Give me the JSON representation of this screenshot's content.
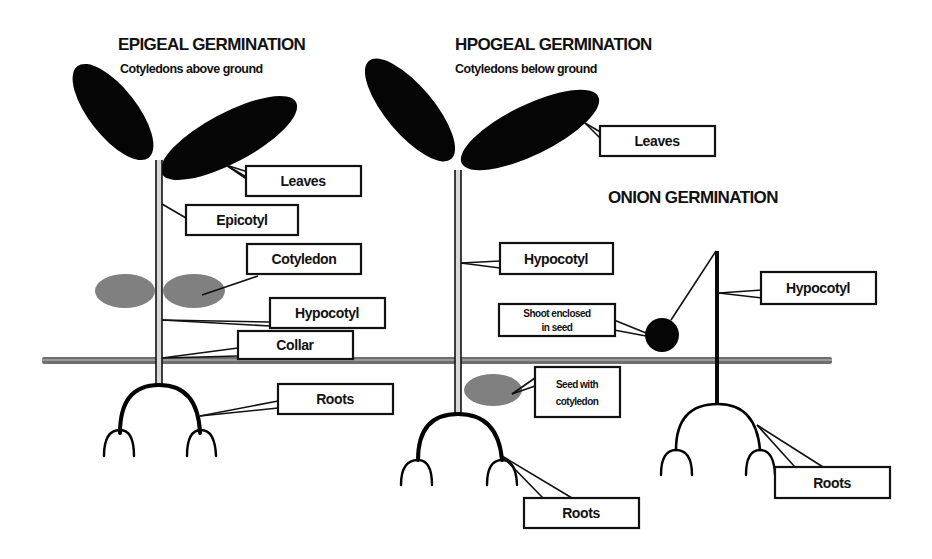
{
  "diagram": {
    "epigeal": {
      "title": "EPIGEAL GERMINATION",
      "subtitle": "Cotyledons above ground",
      "labels": {
        "leaves": "Leaves",
        "epicotyl": "Epicotyl",
        "cotyledon": "Cotyledon",
        "hypocotyl": "Hypocotyl",
        "collar": "Collar",
        "roots": "Roots"
      }
    },
    "hypogeal": {
      "title": "HPOGEAL GERMINATION",
      "subtitle": "Cotyledons below ground",
      "labels": {
        "leaves": "Leaves",
        "hypocotyl": "Hypocotyl",
        "seed_with_cotyledon_line1": "Seed with",
        "seed_with_cotyledon_line2": "cotyledon",
        "roots": "Roots"
      }
    },
    "onion": {
      "title": "ONION GERMINATION",
      "labels": {
        "shoot_enclosed_line1": "Shoot enclosed",
        "shoot_enclosed_line2": "in seed",
        "hypocotyl": "Hypocotyl",
        "roots": "Roots"
      }
    },
    "colors": {
      "leaf": "#050505",
      "cotyledon": "#808080",
      "ground": "#6e6e6e",
      "background": "#ffffff"
    }
  }
}
